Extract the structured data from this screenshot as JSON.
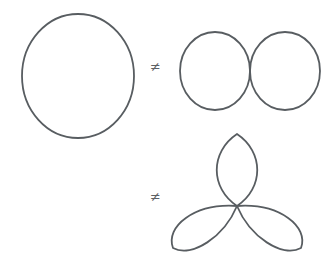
{
  "figure": {
    "background_color": "#ffffff",
    "stroke_color": "#585d61",
    "stroke_width": 1.8,
    "canvas": {
      "width": 336,
      "height": 272
    }
  },
  "relations": [
    {
      "id": "neq-top",
      "symbol": "≠",
      "icon": "not-equal-icon",
      "left_operand": "single-circle",
      "right_operand": "two-tangent-circles",
      "position": {
        "x": 150,
        "y": 60
      }
    },
    {
      "id": "neq-bottom",
      "symbol": "≠",
      "icon": "not-equal-icon",
      "left_operand": "single-circle",
      "right_operand": "three-petal-rose",
      "position": {
        "x": 150,
        "y": 190
      }
    }
  ],
  "shapes": {
    "single_circle": {
      "label": "single-circle",
      "type": "ellipse",
      "cx": 78,
      "cy": 76,
      "rx": 56,
      "ry": 62
    },
    "two_tangent_circles": {
      "label": "two-tangent-circles",
      "type": "ellipse-pair",
      "circles": [
        {
          "cx": 215,
          "cy": 71,
          "rx": 35,
          "ry": 39
        },
        {
          "cx": 285,
          "cy": 71,
          "rx": 35,
          "ry": 39
        }
      ],
      "tangent_point": {
        "x": 250,
        "y": 71
      }
    },
    "three_petal_rose": {
      "label": "three-petal-rose",
      "type": "rose-curve",
      "petal_count": 3,
      "center": {
        "x": 237,
        "y": 206
      },
      "petal_length": 74,
      "petal_width": 48,
      "petal_angles_deg": [
        270,
        30,
        150
      ]
    }
  }
}
